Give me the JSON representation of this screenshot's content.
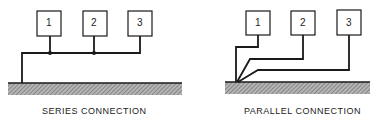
{
  "diagrams": [
    {
      "title": "SERIES CONNECTION",
      "boxes": [
        "1",
        "2",
        "3"
      ]
    },
    {
      "title": "PARALLEL CONNECTION",
      "boxes": [
        "1",
        "2",
        "3"
      ]
    }
  ],
  "colors": {
    "line": "#1a1a1a",
    "ground": "#8a8a8a"
  }
}
